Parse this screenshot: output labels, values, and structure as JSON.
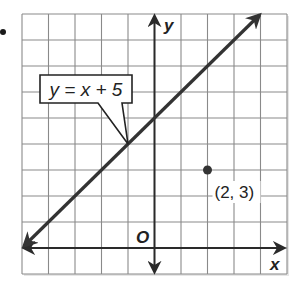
{
  "problem": {
    "bullet": "•"
  },
  "chart_data": {
    "type": "line",
    "title": "",
    "xlabel": "x",
    "ylabel": "y",
    "origin_label": "O",
    "xlim": [
      -5,
      5
    ],
    "ylim": [
      -1,
      9
    ],
    "grid": true,
    "grid_step": 1,
    "tick_labels_shown": false,
    "series": [
      {
        "name": "y = x + 5",
        "equation": "y = x + 5",
        "slope": 1,
        "intercept": 5,
        "points": [
          [
            -5,
            0
          ],
          [
            4,
            9
          ]
        ],
        "arrows_both_ends": true,
        "color": "#333333"
      }
    ],
    "points": [
      {
        "x": 2,
        "y": 3,
        "label": "(2, 3)",
        "color": "#333333"
      }
    ],
    "annotations": [
      {
        "text": "y = x + 5",
        "type": "callout",
        "points_to": [
          -1,
          4
        ]
      }
    ]
  },
  "labels": {
    "callout": "y = x + 5",
    "point": "(2, 3)",
    "x_axis": "x",
    "y_axis": "y",
    "origin": "O"
  },
  "colors": {
    "grid": "#8a8a8a",
    "axes": "#2a2a2a",
    "line": "#333333",
    "frame_shadow": "#cfcfcf"
  }
}
